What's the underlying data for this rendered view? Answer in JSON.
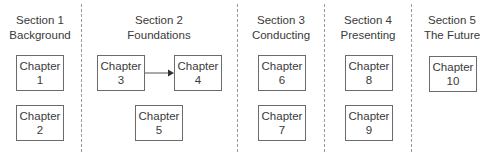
{
  "sections": [
    {
      "label": "Section 1",
      "subtitle": "Background"
    },
    {
      "label": "Section 2",
      "subtitle": "Foundations"
    },
    {
      "label": "Section 3",
      "subtitle": "Conducting"
    },
    {
      "label": "Section 4",
      "subtitle": "Presenting"
    },
    {
      "label": "Section 5",
      "subtitle": "The Future"
    }
  ],
  "chapters": [
    {
      "label": "Chapter",
      "number": "1"
    },
    {
      "label": "Chapter",
      "number": "2"
    },
    {
      "label": "Chapter",
      "number": "3"
    },
    {
      "label": "Chapter",
      "number": "4"
    },
    {
      "label": "Chapter",
      "number": "5"
    },
    {
      "label": "Chapter",
      "number": "6"
    },
    {
      "label": "Chapter",
      "number": "7"
    },
    {
      "label": "Chapter",
      "number": "8"
    },
    {
      "label": "Chapter",
      "number": "9"
    },
    {
      "label": "Chapter",
      "number": "10"
    }
  ],
  "edges": [
    {
      "from": "3",
      "to": "4"
    }
  ],
  "colors": {
    "box_border": "#6b6b6b",
    "divider": "#9a9a9a",
    "text": "#3a3a3a"
  }
}
